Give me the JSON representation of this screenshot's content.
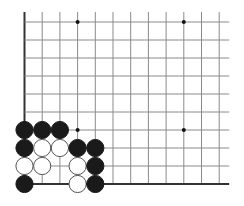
{
  "board": {
    "type": "go-diagram",
    "view": "bottom-left corner",
    "columns_visible": 12,
    "rows_visible": 10,
    "origin": {
      "x": 24.5,
      "y": 22
    },
    "spacing": {
      "x": 17.7,
      "y": 18
    },
    "open_edges": [
      "top",
      "right"
    ],
    "closed_edges": [
      "left",
      "bottom"
    ],
    "colors": {
      "background": "#ffffff",
      "grid_line": "#8a8a8a",
      "edge_line": "#333333",
      "black_stone": "#1a1a1a",
      "white_stone_fill": "#ffffff",
      "white_stone_stroke": "#555555",
      "star_point": "#111111"
    },
    "star_points": [
      {
        "col": 3,
        "row": 0
      },
      {
        "col": 9,
        "row": 0
      },
      {
        "col": 3,
        "row": 6
      },
      {
        "col": 9,
        "row": 6
      }
    ],
    "stones": [
      {
        "color": "black",
        "col": 0,
        "row": 6
      },
      {
        "color": "black",
        "col": 1,
        "row": 6
      },
      {
        "color": "black",
        "col": 2,
        "row": 6
      },
      {
        "color": "black",
        "col": 0,
        "row": 7
      },
      {
        "color": "white",
        "col": 1,
        "row": 7
      },
      {
        "color": "white",
        "col": 2,
        "row": 7
      },
      {
        "color": "black",
        "col": 3,
        "row": 7
      },
      {
        "color": "black",
        "col": 4,
        "row": 7
      },
      {
        "color": "white",
        "col": 0,
        "row": 8
      },
      {
        "color": "white",
        "col": 1,
        "row": 8
      },
      {
        "color": "white",
        "col": 3,
        "row": 8
      },
      {
        "color": "black",
        "col": 4,
        "row": 8
      },
      {
        "color": "black",
        "col": 0,
        "row": 9
      },
      {
        "color": "white",
        "col": 3,
        "row": 9
      },
      {
        "color": "black",
        "col": 4,
        "row": 9
      }
    ]
  }
}
